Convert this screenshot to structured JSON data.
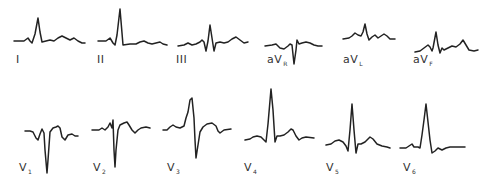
{
  "figure": {
    "trace_color": "#222222",
    "label_color": "#333333",
    "background": "#ffffff"
  },
  "leads": [
    {
      "id": "I",
      "label": "I",
      "sub": "",
      "label_pos": [
        16,
        64
      ],
      "points": [
        [
          14,
          41
        ],
        [
          24,
          41
        ],
        [
          28,
          38
        ],
        [
          30,
          41
        ],
        [
          32,
          43
        ],
        [
          35,
          34
        ],
        [
          38,
          18
        ],
        [
          40,
          32
        ],
        [
          42,
          42
        ],
        [
          46,
          41
        ],
        [
          50,
          40
        ],
        [
          54,
          41
        ],
        [
          58,
          38
        ],
        [
          62,
          36
        ],
        [
          66,
          38
        ],
        [
          70,
          40
        ],
        [
          74,
          38
        ],
        [
          78,
          41
        ],
        [
          82,
          43
        ],
        [
          85,
          43
        ]
      ]
    },
    {
      "id": "II",
      "label": "II",
      "sub": "",
      "label_pos": [
        97,
        64
      ],
      "points": [
        [
          98,
          41
        ],
        [
          106,
          41
        ],
        [
          110,
          38
        ],
        [
          113,
          43
        ],
        [
          115,
          45
        ],
        [
          117,
          35
        ],
        [
          120,
          9
        ],
        [
          123,
          45
        ],
        [
          130,
          44
        ],
        [
          136,
          44
        ],
        [
          140,
          42
        ],
        [
          144,
          41
        ],
        [
          148,
          43
        ],
        [
          152,
          44
        ],
        [
          156,
          43
        ],
        [
          160,
          42
        ],
        [
          163,
          44
        ],
        [
          167,
          45
        ]
      ]
    },
    {
      "id": "III",
      "label": "III",
      "sub": "",
      "label_pos": [
        176,
        64
      ],
      "points": [
        [
          178,
          46
        ],
        [
          184,
          45
        ],
        [
          188,
          43
        ],
        [
          192,
          45
        ],
        [
          196,
          44
        ],
        [
          200,
          42
        ],
        [
          202,
          40
        ],
        [
          204,
          42
        ],
        [
          206,
          51
        ],
        [
          208,
          41
        ],
        [
          210,
          25
        ],
        [
          212,
          38
        ],
        [
          214,
          51
        ],
        [
          216,
          43
        ],
        [
          220,
          42
        ],
        [
          224,
          43
        ],
        [
          228,
          42
        ],
        [
          232,
          39
        ],
        [
          236,
          37
        ],
        [
          240,
          40
        ],
        [
          244,
          43
        ],
        [
          248,
          42
        ]
      ]
    },
    {
      "id": "aVR",
      "label": "aV",
      "sub": "R",
      "label_pos": [
        267,
        64
      ],
      "points": [
        [
          265,
          46
        ],
        [
          272,
          45
        ],
        [
          276,
          44
        ],
        [
          280,
          48
        ],
        [
          284,
          49
        ],
        [
          288,
          46
        ],
        [
          290,
          44
        ],
        [
          292,
          45
        ],
        [
          294,
          64
        ],
        [
          296,
          50
        ],
        [
          297,
          40
        ],
        [
          299,
          44
        ],
        [
          302,
          43
        ],
        [
          306,
          42
        ],
        [
          310,
          43
        ],
        [
          314,
          45
        ],
        [
          318,
          46
        ],
        [
          322,
          46
        ]
      ]
    },
    {
      "id": "aVL",
      "label": "aV",
      "sub": "L",
      "label_pos": [
        343,
        64
      ],
      "points": [
        [
          343,
          39
        ],
        [
          349,
          38
        ],
        [
          352,
          36
        ],
        [
          355,
          33
        ],
        [
          358,
          35
        ],
        [
          361,
          36
        ],
        [
          363,
          32
        ],
        [
          365,
          24
        ],
        [
          367,
          34
        ],
        [
          369,
          40
        ],
        [
          372,
          37
        ],
        [
          375,
          35
        ],
        [
          378,
          38
        ],
        [
          381,
          36
        ],
        [
          384,
          34
        ],
        [
          387,
          36
        ],
        [
          390,
          39
        ],
        [
          395,
          39
        ]
      ]
    },
    {
      "id": "aVF",
      "label": "aV",
      "sub": "F",
      "label_pos": [
        413,
        64
      ],
      "points": [
        [
          415,
          52
        ],
        [
          420,
          51
        ],
        [
          424,
          48
        ],
        [
          428,
          45
        ],
        [
          430,
          47
        ],
        [
          432,
          51
        ],
        [
          433,
          48
        ],
        [
          436,
          32
        ],
        [
          438,
          45
        ],
        [
          440,
          53
        ],
        [
          442,
          48
        ],
        [
          444,
          50
        ],
        [
          448,
          48
        ],
        [
          452,
          46
        ],
        [
          456,
          47
        ],
        [
          460,
          44
        ],
        [
          463,
          40
        ],
        [
          466,
          45
        ],
        [
          469,
          50
        ],
        [
          474,
          51
        ],
        [
          478,
          50
        ]
      ]
    },
    {
      "id": "V1",
      "label": "V",
      "sub": "1",
      "label_pos": [
        19,
        172
      ],
      "points": [
        [
          25,
          131
        ],
        [
          30,
          131
        ],
        [
          33,
          132
        ],
        [
          36,
          138
        ],
        [
          38,
          140
        ],
        [
          40,
          134
        ],
        [
          42,
          129
        ],
        [
          44,
          133
        ],
        [
          45,
          150
        ],
        [
          47,
          173
        ],
        [
          48,
          160
        ],
        [
          50,
          132
        ],
        [
          53,
          128
        ],
        [
          56,
          127
        ],
        [
          58,
          126
        ],
        [
          60,
          128
        ],
        [
          62,
          137
        ],
        [
          65,
          140
        ],
        [
          68,
          135
        ],
        [
          72,
          134
        ],
        [
          75,
          136
        ],
        [
          78,
          136
        ]
      ]
    },
    {
      "id": "V2",
      "label": "V",
      "sub": "2",
      "label_pos": [
        93,
        172
      ],
      "points": [
        [
          92,
          130
        ],
        [
          99,
          130
        ],
        [
          102,
          128
        ],
        [
          105,
          130
        ],
        [
          108,
          127
        ],
        [
          110,
          123
        ],
        [
          112,
          128
        ],
        [
          113,
          120
        ],
        [
          114,
          150
        ],
        [
          115,
          167
        ],
        [
          116,
          150
        ],
        [
          118,
          130
        ],
        [
          120,
          125
        ],
        [
          124,
          123
        ],
        [
          127,
          122
        ],
        [
          129,
          125
        ],
        [
          132,
          130
        ],
        [
          135,
          133
        ],
        [
          138,
          130
        ],
        [
          141,
          128
        ],
        [
          146,
          127
        ],
        [
          150,
          128
        ]
      ]
    },
    {
      "id": "V3",
      "label": "V",
      "sub": "3",
      "label_pos": [
        167,
        172
      ],
      "points": [
        [
          163,
          130
        ],
        [
          167,
          130
        ],
        [
          170,
          127
        ],
        [
          173,
          125
        ],
        [
          176,
          127
        ],
        [
          180,
          128
        ],
        [
          184,
          126
        ],
        [
          186,
          118
        ],
        [
          188,
          112
        ],
        [
          190,
          100
        ],
        [
          192,
          98
        ],
        [
          194,
          118
        ],
        [
          195,
          140
        ],
        [
          196,
          158
        ],
        [
          198,
          145
        ],
        [
          200,
          132
        ],
        [
          203,
          127
        ],
        [
          207,
          124
        ],
        [
          212,
          123
        ],
        [
          216,
          126
        ],
        [
          218,
          131
        ],
        [
          220,
          133
        ],
        [
          224,
          130
        ],
        [
          231,
          129
        ]
      ]
    },
    {
      "id": "V4",
      "label": "V",
      "sub": "4",
      "label_pos": [
        244,
        172
      ],
      "points": [
        [
          245,
          140
        ],
        [
          250,
          139
        ],
        [
          253,
          137
        ],
        [
          257,
          136
        ],
        [
          261,
          137
        ],
        [
          264,
          140
        ],
        [
          266,
          142
        ],
        [
          268,
          124
        ],
        [
          271,
          89
        ],
        [
          273,
          110
        ],
        [
          275,
          142
        ],
        [
          277,
          136
        ],
        [
          280,
          136
        ],
        [
          284,
          135
        ],
        [
          288,
          132
        ],
        [
          291,
          129
        ],
        [
          293,
          130
        ],
        [
          296,
          136
        ],
        [
          299,
          140
        ],
        [
          302,
          138
        ],
        [
          306,
          137
        ],
        [
          314,
          138
        ]
      ]
    },
    {
      "id": "V5",
      "label": "V",
      "sub": "5",
      "label_pos": [
        326,
        172
      ],
      "points": [
        [
          326,
          145
        ],
        [
          331,
          144
        ],
        [
          335,
          141
        ],
        [
          339,
          140
        ],
        [
          343,
          142
        ],
        [
          346,
          146
        ],
        [
          348,
          151
        ],
        [
          350,
          130
        ],
        [
          352,
          104
        ],
        [
          354,
          130
        ],
        [
          356,
          153
        ],
        [
          358,
          144
        ],
        [
          361,
          144
        ],
        [
          365,
          142
        ],
        [
          368,
          139
        ],
        [
          370,
          137
        ],
        [
          373,
          139
        ],
        [
          377,
          144
        ],
        [
          382,
          146
        ],
        [
          387,
          147
        ],
        [
          390,
          148
        ]
      ]
    },
    {
      "id": "V6",
      "label": "V",
      "sub": "6",
      "label_pos": [
        403,
        172
      ],
      "points": [
        [
          400,
          148
        ],
        [
          406,
          148
        ],
        [
          409,
          146
        ],
        [
          412,
          144
        ],
        [
          414,
          147
        ],
        [
          418,
          147
        ],
        [
          420,
          148
        ],
        [
          422,
          135
        ],
        [
          424,
          120
        ],
        [
          426,
          104
        ],
        [
          428,
          122
        ],
        [
          430,
          140
        ],
        [
          432,
          153
        ],
        [
          435,
          151
        ],
        [
          438,
          148
        ],
        [
          442,
          150
        ],
        [
          446,
          148
        ],
        [
          450,
          147
        ],
        [
          455,
          147
        ],
        [
          465,
          147
        ]
      ]
    }
  ]
}
